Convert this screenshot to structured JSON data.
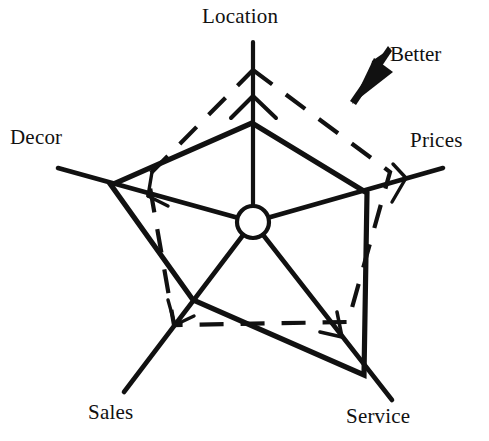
{
  "chart_data": {
    "type": "radar",
    "title": "",
    "categories": [
      "Location",
      "Prices",
      "Service",
      "Sales",
      "Decor"
    ],
    "grid": false,
    "legend_position": "none",
    "axis_direction_note": "Better",
    "series": [
      {
        "name": "current",
        "style": "solid",
        "values": [
          0.62,
          0.68,
          0.92,
          0.52,
          0.58
        ],
        "points": [
          {
            "axis": "Location",
            "x": 252,
            "y": 123
          },
          {
            "axis": "Prices",
            "x": 367,
            "y": 193
          },
          {
            "axis": "Service",
            "x": 364,
            "y": 375
          },
          {
            "axis": "Sales",
            "x": 193,
            "y": 300
          },
          {
            "axis": "Decor",
            "x": 111,
            "y": 185
          }
        ]
      },
      {
        "name": "target",
        "style": "dashed",
        "values": [
          0.98,
          0.88,
          0.6,
          0.62,
          0.42
        ],
        "points": [
          {
            "axis": "Location",
            "x": 253,
            "y": 70
          },
          {
            "axis": "Prices",
            "x": 390,
            "y": 172
          },
          {
            "axis": "Service",
            "x": 348,
            "y": 322
          },
          {
            "axis": "Sales",
            "x": 174,
            "y": 325
          },
          {
            "axis": "Decor",
            "x": 148,
            "y": 176
          }
        ]
      }
    ],
    "hub": {
      "x": 253,
      "y": 222,
      "r": 16
    },
    "axes_geometry": [
      {
        "label": "Location",
        "tip_x": 253,
        "tip_y": 42,
        "angle_deg": 270
      },
      {
        "label": "Prices",
        "tip_x": 443,
        "tip_y": 168,
        "angle_deg": 343
      },
      {
        "label": "Service",
        "tip_x": 392,
        "tip_y": 400,
        "angle_deg": 55
      },
      {
        "label": "Sales",
        "tip_x": 124,
        "tip_y": 392,
        "angle_deg": 128
      },
      {
        "label": "Decor",
        "tip_x": 58,
        "tip_y": 168,
        "angle_deg": 197
      }
    ]
  },
  "labels": {
    "location": "Location",
    "prices": "Prices",
    "service": "Service",
    "sales": "Sales",
    "decor": "Decor"
  },
  "annotation": {
    "better": "Better"
  },
  "colors": {
    "ink": "#111111",
    "background": "#ffffff"
  }
}
